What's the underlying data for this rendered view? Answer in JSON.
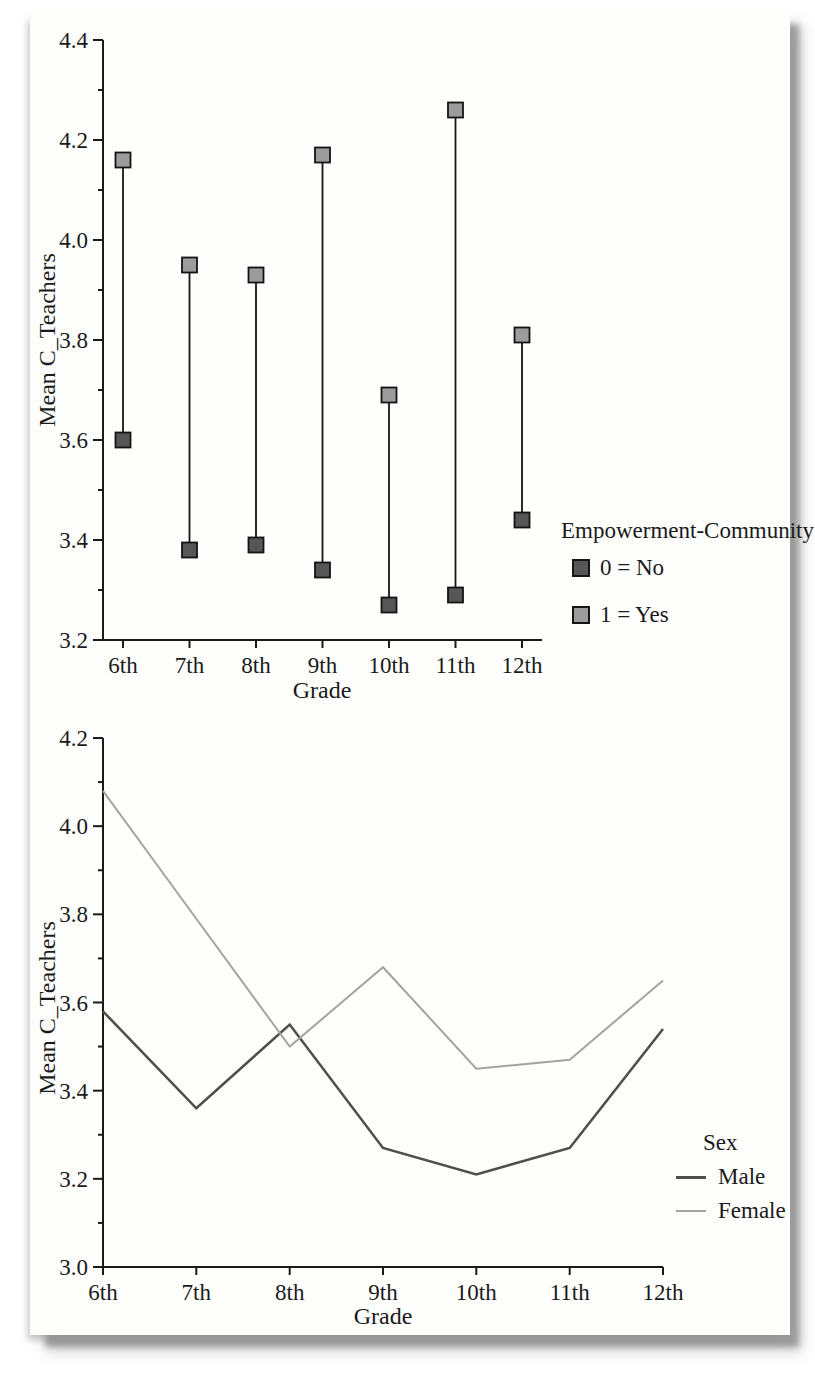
{
  "chart_data": [
    {
      "type": "scatter",
      "style": "drop-line-pairs",
      "title": "",
      "categories": [
        "6th",
        "7th",
        "8th",
        "9th",
        "10th",
        "11th",
        "12th"
      ],
      "series": [
        {
          "name": "0 = No",
          "marker": "dark-square",
          "color": "#565656",
          "values": [
            3.6,
            3.38,
            3.39,
            3.34,
            3.27,
            3.29,
            3.44
          ]
        },
        {
          "name": "1 = Yes",
          "marker": "light-square",
          "color": "#9c9c9c",
          "values": [
            4.16,
            3.95,
            3.93,
            4.17,
            3.69,
            4.26,
            3.81
          ]
        }
      ],
      "xlabel": "Grade",
      "ylabel": "Mean C_Teachers",
      "ylim": [
        3.2,
        4.4
      ],
      "ytick_step": 0.2,
      "yminor_step": 0.1,
      "grid": false,
      "legend": {
        "title": "Empowerment-Community",
        "position": "right-lower",
        "entries": [
          "0 = No",
          "1 = Yes"
        ]
      }
    },
    {
      "type": "line",
      "title": "",
      "categories": [
        "6th",
        "7th",
        "8th",
        "9th",
        "10th",
        "11th",
        "12th"
      ],
      "series": [
        {
          "name": "Male",
          "color": "#4f4f4f",
          "line_width": 2.6,
          "values": [
            3.58,
            3.36,
            3.55,
            3.27,
            3.21,
            3.27,
            3.54
          ]
        },
        {
          "name": "Female",
          "color": "#a3a3a3",
          "line_width": 2.0,
          "values": [
            4.08,
            3.79,
            3.5,
            3.68,
            3.45,
            3.47,
            3.65
          ]
        }
      ],
      "xlabel": "Grade",
      "ylabel": "Mean C_Teachers",
      "ylim": [
        3.0,
        4.2
      ],
      "ytick_step": 0.2,
      "yminor_step": 0.1,
      "grid": false,
      "legend": {
        "title": "Sex",
        "position": "right-lower",
        "entries": [
          "Male",
          "Female"
        ]
      }
    }
  ],
  "colors": {
    "axis": "#1a1a1a",
    "dark_marker": "#565656",
    "light_marker": "#9c9c9c",
    "male_line": "#4f4f4f",
    "female_line": "#a3a3a3",
    "card_shadow": "#8e8e8e"
  }
}
